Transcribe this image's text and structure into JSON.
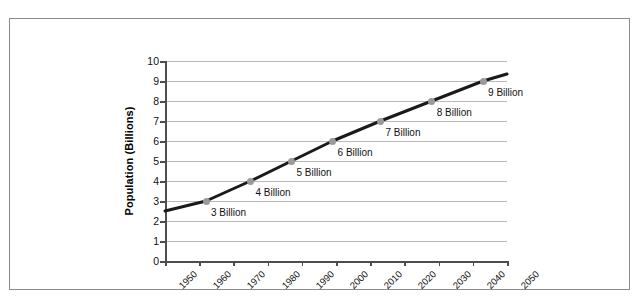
{
  "chart_data": {
    "type": "line",
    "title": "",
    "xlabel": "",
    "ylabel": "Population (Billions)",
    "xlim": [
      1950,
      2050
    ],
    "ylim": [
      0,
      10
    ],
    "grid": true,
    "legend": "none",
    "x_ticks": [
      "1950",
      "1960",
      "1970",
      "1980",
      "1990",
      "2000",
      "2010",
      "2020",
      "2030",
      "2040",
      "2050"
    ],
    "y_ticks": [
      "0",
      "1",
      "2",
      "3",
      "4",
      "5",
      "6",
      "7",
      "8",
      "9",
      "10"
    ],
    "series": [
      {
        "name": "World population",
        "x": [
          1950,
          1962,
          1975,
          1987,
          1999,
          2013,
          2028,
          2043,
          2050
        ],
        "y": [
          2.5,
          3.0,
          4.0,
          5.0,
          6.0,
          7.0,
          8.0,
          9.0,
          9.35
        ],
        "line_color": "#1a1a1a",
        "marker_color": "#9a9a9a"
      }
    ],
    "point_labels": [
      {
        "text": "3 Billion",
        "x": 1962,
        "y": 3.0
      },
      {
        "text": "4 Billion",
        "x": 1975,
        "y": 4.0
      },
      {
        "text": "5 Billion",
        "x": 1987,
        "y": 5.0
      },
      {
        "text": "6 Billion",
        "x": 1999,
        "y": 6.0
      },
      {
        "text": "7 Billion",
        "x": 2013,
        "y": 7.0
      },
      {
        "text": "8 Billion",
        "x": 2028,
        "y": 8.0
      },
      {
        "text": "9 Billion",
        "x": 2043,
        "y": 9.0
      }
    ]
  }
}
